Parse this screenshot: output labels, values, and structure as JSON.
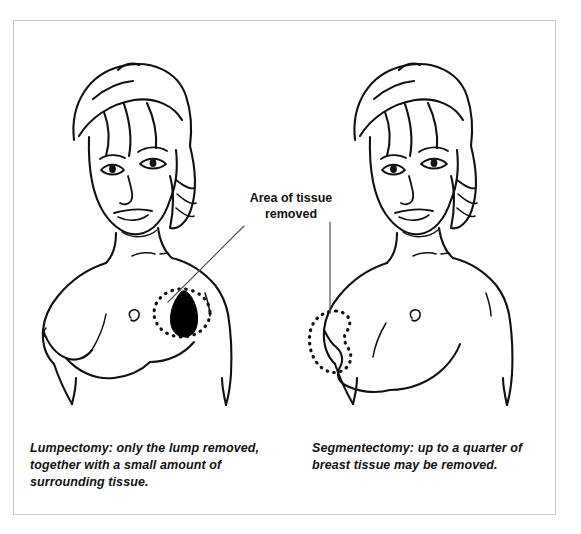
{
  "figure": {
    "type": "medical-line-illustration",
    "background_color": "#ffffff",
    "frame_color": "#c9c9c9",
    "ink_color": "#111111"
  },
  "annotation": {
    "label_line1": "Area of tissue",
    "label_line2": "removed",
    "leader_left_name": "leader-line-to-lumpectomy",
    "leader_right_name": "leader-line-to-segmentectomy"
  },
  "panels": [
    {
      "id": "lumpectomy",
      "figure_name": "female-torso-lumpectomy",
      "caption": "Lumpectomy: only the lump removed, together with a small amount of surrounding tissue.",
      "marker_shape": "dotted-ellipse-with-solid-tumor",
      "tumor_fill": "#000000"
    },
    {
      "id": "segmentectomy",
      "figure_name": "female-torso-segmentectomy",
      "caption": "Segmentectomy: up to a quarter of breast tissue may be removed.",
      "marker_shape": "dotted-wedge-outline",
      "tumor_fill": "none"
    }
  ]
}
